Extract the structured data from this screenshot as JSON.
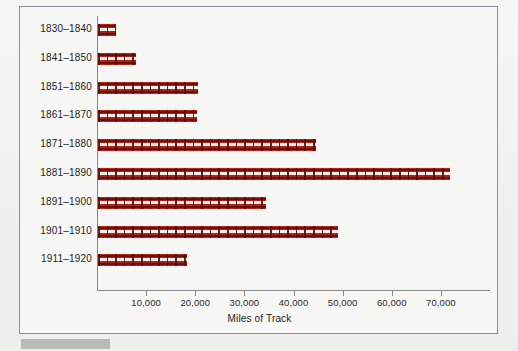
{
  "figure": {
    "caption_bar_color": "#b9b9b9",
    "frame_color": "#8d8f92",
    "bar_color": "#6d0f0a",
    "bar_highlight_color": "#b5281c"
  },
  "chart_data": {
    "type": "bar",
    "orientation": "horizontal",
    "title": "",
    "xlabel": "Miles of Track",
    "ylabel": "",
    "categories": [
      "1830–1840",
      "1841–1850",
      "1851–1860",
      "1861–1870",
      "1871–1880",
      "1881–1890",
      "1891–1900",
      "1901–1910",
      "1911–1920"
    ],
    "values": [
      3700,
      7650,
      20300,
      20100,
      44400,
      71650,
      34200,
      48800,
      18100
    ],
    "xlim": [
      0,
      80000
    ],
    "xticks": [
      10000,
      20000,
      30000,
      40000,
      50000,
      60000,
      70000
    ],
    "xtick_labels": [
      "10,000",
      "20,000",
      "30,000",
      "40,000",
      "50,000",
      "60,000",
      "70,000"
    ],
    "grid": false,
    "legend": null,
    "bar_style": "railroad-track"
  }
}
